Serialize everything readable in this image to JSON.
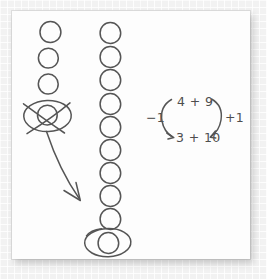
{
  "canvas": {
    "width": 267,
    "height": 279,
    "background_color": "#f2f2f2",
    "paper_color": "#fdfdfd",
    "ink_color": "#555555"
  },
  "worksheet": {
    "title_visible": false,
    "left_column": {
      "label": "left-ten-frame-column",
      "circle_count": 4,
      "circles": [
        {
          "index": 1,
          "cx": 50,
          "cy": 32,
          "r": 10.5,
          "state": "plain"
        },
        {
          "index": 2,
          "cx": 48,
          "cy": 58,
          "r": 10,
          "state": "plain"
        },
        {
          "index": 3,
          "cx": 48,
          "cy": 84,
          "r": 10,
          "state": "plain"
        },
        {
          "index": 4,
          "cx": 47,
          "cy": 115,
          "r": 10,
          "state": "crossed-out"
        }
      ],
      "crossed_out_count": 1,
      "remaining_count": 3,
      "annotation": "bottom circle is enclosed in an ellipse and crossed out with an X"
    },
    "right_column": {
      "label": "right-ten-frame-column",
      "circle_count": 10,
      "circles": [
        {
          "index": 1,
          "cx": 110,
          "cy": 33,
          "r": 10.5,
          "state": "plain"
        },
        {
          "index": 2,
          "cx": 110,
          "cy": 57,
          "r": 10.5,
          "state": "plain"
        },
        {
          "index": 3,
          "cx": 110,
          "cy": 80,
          "r": 10.5,
          "state": "plain"
        },
        {
          "index": 4,
          "cx": 110,
          "cy": 104,
          "r": 10.5,
          "state": "plain"
        },
        {
          "index": 5,
          "cx": 110,
          "cy": 127,
          "r": 10.5,
          "state": "plain"
        },
        {
          "index": 6,
          "cx": 110,
          "cy": 150,
          "r": 10.5,
          "state": "plain"
        },
        {
          "index": 7,
          "cx": 110,
          "cy": 173,
          "r": 10.5,
          "state": "plain"
        },
        {
          "index": 8,
          "cx": 110,
          "cy": 196,
          "r": 10.5,
          "state": "plain"
        },
        {
          "index": 9,
          "cx": 110,
          "cy": 219,
          "r": 10.5,
          "state": "plain"
        },
        {
          "index": 10,
          "cx": 108,
          "cy": 243,
          "r": 10.5,
          "state": "circled"
        }
      ],
      "added_count": 1,
      "annotation": "bottom circle is enclosed in an ellipse marking the moved counter"
    },
    "arrow": {
      "label": "move-counter-arrow",
      "from": "left column crossed-out circle",
      "to": "right column bottom circle",
      "style": "curved arrow with arrowhead"
    }
  },
  "equation": {
    "label": "compensation-strategy",
    "top_expression": "4 + 9",
    "bottom_expression": "3 + 10",
    "left_annotation": "−1",
    "right_annotation": "+1",
    "left_arrow_label": "curved-arrow-down-left",
    "right_arrow_label": "curved-arrow-down-right",
    "meaning": "subtract 1 from the first addend and add 1 to the second addend"
  }
}
